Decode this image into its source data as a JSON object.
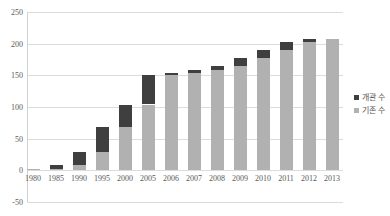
{
  "chart_data": {
    "type": "bar",
    "stacked": true,
    "title": "",
    "xlabel": "",
    "ylabel": "",
    "categories": [
      "1980",
      "1985",
      "1990",
      "1995",
      "2000",
      "2005",
      "2006",
      "2007",
      "2008",
      "2009",
      "2010",
      "2011",
      "2012",
      "2013"
    ],
    "series": [
      {
        "name": "개관 수",
        "color": "#3f3f3f",
        "values": [
          0,
          6,
          21,
          39,
          36,
          47,
          3,
          4,
          7,
          13,
          12,
          12,
          5,
          0
        ]
      },
      {
        "name": "기존 수",
        "color": "#b1b1b1",
        "values": [
          2,
          2,
          8,
          29,
          68,
          104,
          151,
          154,
          158,
          165,
          178,
          190,
          202,
          207
        ]
      }
    ],
    "stack_bottom_to_top": [
      "기존 수",
      "개관 수"
    ],
    "ylim": [
      -50,
      250
    ],
    "y_ticks": [
      250,
      200,
      150,
      100,
      50,
      0,
      -50
    ],
    "grid": true,
    "legend_position": "right",
    "grid_color": "#dcdcdc",
    "text_color": "#595959"
  }
}
